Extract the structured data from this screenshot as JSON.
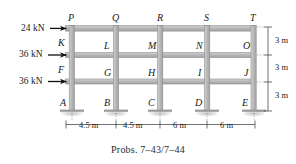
{
  "figure": {
    "title_caption": "Probs. 7–43/7–44",
    "type": "structural-frame-diagram",
    "stories": 3,
    "bays": 4,
    "colors": {
      "member_fill": "#b9b9b9",
      "member_edge": "#8d8d8d",
      "highlight": "#d8d8d8",
      "text": "#1a1a1a",
      "shadow": "#cfcfcf"
    }
  },
  "loads": [
    {
      "id": "load-top",
      "magnitude": "24 kN",
      "applied_at": "P",
      "direction": "right"
    },
    {
      "id": "load-middle",
      "magnitude": "36 kN",
      "applied_at": "K",
      "direction": "right"
    },
    {
      "id": "load-bottom",
      "magnitude": "36 kN",
      "applied_at": "F",
      "direction": "right"
    }
  ],
  "joint_labels": {
    "roof": [
      "P",
      "Q",
      "R",
      "S",
      "T"
    ],
    "level_three": [
      "K",
      "L",
      "M",
      "N",
      "O"
    ],
    "level_two": [
      "F",
      "G",
      "H",
      "I",
      "J"
    ],
    "base": [
      "A",
      "B",
      "C",
      "D",
      "E"
    ]
  },
  "dimensions": {
    "horizontal": [
      "4.5 m",
      "4.5 m",
      "6 m",
      "6 m"
    ],
    "vertical": [
      "3 m",
      "3 m",
      "3 m"
    ]
  },
  "supports": {
    "type": "fixed",
    "nodes": [
      "A",
      "B",
      "C",
      "D",
      "E"
    ],
    "count": 5
  }
}
